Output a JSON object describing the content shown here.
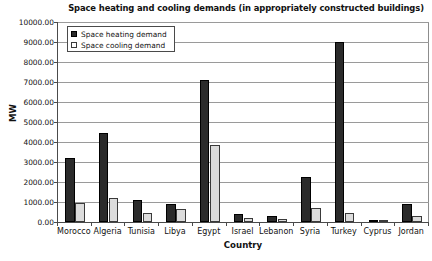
{
  "chart_data": {
    "type": "bar",
    "title": "Space heating and cooling demands (in appropriately constructed buildings)",
    "xlabel": "Country",
    "ylabel": "MW",
    "ylim": [
      0,
      10000
    ],
    "ytick_step": 1000,
    "ytick_labels": [
      "10000.00",
      "9000.00",
      "8000.00",
      "7000.00",
      "6000.00",
      "5000.00",
      "4000.00",
      "3000.00",
      "2000.00",
      "1000.00",
      "0.00"
    ],
    "grid": true,
    "legend_position": "upper-left-inside",
    "categories": [
      "Morocco",
      "Algeria",
      "Tunisia",
      "Libya",
      "Egypt",
      "Israel",
      "Lebanon",
      "Syria",
      "Turkey",
      "Cyprus",
      "Jordan"
    ],
    "series": [
      {
        "name": "Space heating demand",
        "color": "#2b2b2b",
        "values": [
          3200,
          4450,
          1100,
          900,
          7100,
          420,
          300,
          2250,
          9000,
          60,
          900
        ]
      },
      {
        "name": "Space cooling demand",
        "color": "#dcdcdc",
        "values": [
          950,
          1200,
          450,
          650,
          3850,
          200,
          130,
          700,
          450,
          50,
          300
        ]
      }
    ]
  },
  "legend": {
    "items": [
      {
        "label": "Space heating demand",
        "swatch": "filled-square"
      },
      {
        "label": "Space cooling demand",
        "swatch": "outlined-square"
      }
    ]
  },
  "colors": {
    "heating": "#2b2b2b",
    "cooling": "#dcdcdc",
    "axis": "#4a4a4a",
    "grid": "#9a9a9a",
    "background": "#ffffff"
  }
}
